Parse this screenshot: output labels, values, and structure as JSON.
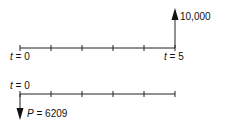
{
  "diagram": {
    "type": "cash-flow-timeline",
    "top_timeline": {
      "periods": 5,
      "start_label": {
        "var": "t",
        "eq": " = 0"
      },
      "end_label": {
        "var": "t",
        "eq": " = 5"
      },
      "cash_flow": {
        "direction": "up",
        "at_period": 5,
        "label": "10,000"
      }
    },
    "bottom_timeline": {
      "periods": 5,
      "start_label": {
        "var": "t",
        "eq": " = 0"
      },
      "cash_flow": {
        "direction": "down",
        "at_period": 0,
        "label_var": "P",
        "label_eq": " = 6209"
      }
    }
  }
}
